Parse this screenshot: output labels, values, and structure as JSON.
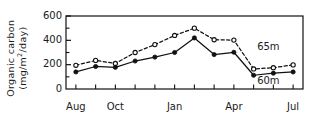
{
  "chart_data": {
    "type": "line",
    "title": "",
    "xlabel": "",
    "ylabel": "Organic carbon (mg/m2/day)",
    "ylabel_line1": "Organic carbon",
    "ylabel_line2_pre": "(mg/m",
    "ylabel_line2_sup": "2",
    "ylabel_line2_post": "/day)",
    "ylim": [
      0,
      600
    ],
    "yticks": [
      0,
      200,
      400,
      600
    ],
    "ytick_labels": [
      "0",
      "200",
      "400",
      "600"
    ],
    "yminor_ticks": [
      100,
      300,
      500
    ],
    "grid": false,
    "legend_position": "right-inline",
    "x": [
      "Aug",
      "Sep",
      "Oct",
      "Nov",
      "Dec",
      "Jan",
      "Feb",
      "Mar",
      "Apr",
      "May",
      "Jun",
      "Jul"
    ],
    "xtick_labels": [
      "Aug",
      "",
      "Oct",
      "",
      "",
      "Jan",
      "",
      "",
      "Apr",
      "",
      "",
      "Jul"
    ],
    "xtick_labels_shown": [
      "Aug",
      "Oct",
      "Jan",
      "Apr",
      "Jul"
    ],
    "xtick_label_indices": [
      0,
      2,
      5,
      8,
      11
    ],
    "series": [
      {
        "name": "65m",
        "label": "65m",
        "marker": "open-circle",
        "linestyle": "dashed",
        "color": "#111111",
        "values": [
          195,
          235,
          210,
          300,
          365,
          440,
          500,
          405,
          402,
          165,
          175,
          198
        ]
      },
      {
        "name": "60m",
        "label": "60m",
        "marker": "filled-circle",
        "linestyle": "solid",
        "color": "#111111",
        "values": [
          140,
          185,
          178,
          230,
          262,
          300,
          420,
          283,
          302,
          113,
          130,
          140
        ]
      }
    ]
  },
  "axis": {
    "frame_color": "#111111"
  }
}
